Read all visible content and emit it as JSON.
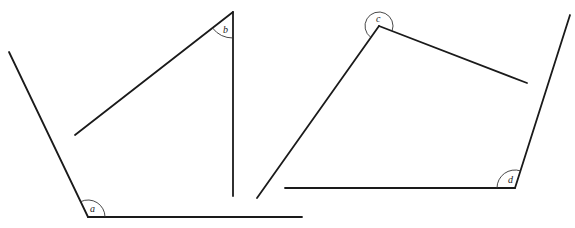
{
  "diagram": {
    "type": "angles",
    "stroke_color": "#1a1a1a",
    "angles": [
      {
        "label": "a",
        "vertex": [
          88,
          217
        ],
        "ray1_end": [
          9,
          52
        ],
        "ray2_end": [
          302,
          217
        ],
        "arc_radius": 17,
        "label_pos": [
          90,
          212
        ]
      },
      {
        "label": "b",
        "vertex": [
          233,
          12
        ],
        "ray1_end": [
          75,
          135
        ],
        "ray2_end": [
          233,
          196
        ],
        "arc_radius": 26,
        "label_pos": [
          223,
          33
        ]
      },
      {
        "label": "c",
        "vertex": [
          379,
          26
        ],
        "ray1_end": [
          257,
          198
        ],
        "ray2_end": [
          527,
          83
        ],
        "arc_radius": 14,
        "label_pos": [
          376,
          22
        ]
      },
      {
        "label": "d",
        "vertex": [
          515,
          188
        ],
        "ray1_end": [
          285,
          188
        ],
        "ray2_end": [
          570,
          15
        ],
        "arc_radius": 18,
        "label_pos": [
          508,
          183
        ]
      }
    ]
  }
}
